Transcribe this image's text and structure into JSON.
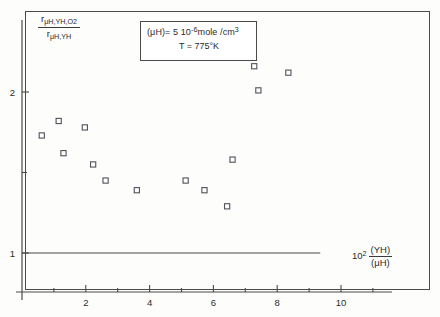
{
  "figure": {
    "background_color": "#fdfdfc",
    "frame_color": "#4a4a4a",
    "marker_color": "#50515a"
  },
  "annotations": {
    "legend_line1_prefix": "(μH)= 5 10",
    "legend_line1_exp": "-6",
    "legend_line1_suffix": "mole /cm",
    "legend_line1_suffix_exp": "3",
    "legend_line2": "T = 775°K"
  },
  "axis_titles": {
    "y_numerator_main": "r",
    "y_numerator_sub": "μH,YH,O",
    "y_numerator_sub2": "2",
    "y_denominator_main": "r",
    "y_denominator_sub": "μH,YH",
    "x_mantissa": "10",
    "x_exponent": "2",
    "x_numerator": "(YH)",
    "x_denominator": "(μH)"
  },
  "chart_data": {
    "type": "scatter",
    "title": "",
    "xlabel": "10^2 (YH)/(μH)",
    "ylabel": "r_{μH,YH,O2} / r_{μH,YH}",
    "xlim": [
      0,
      11.6
    ],
    "ylim": [
      0.78,
      2.55
    ],
    "grid": false,
    "legend_position": "top-center",
    "x_ticks_major": [
      2,
      4,
      6,
      8,
      10
    ],
    "x_ticks_major_labels": [
      "2",
      "4",
      "6",
      "8",
      "10"
    ],
    "x_ticks_minor": [
      1,
      3,
      5,
      7,
      9,
      11
    ],
    "y_ticks_major": [
      1,
      2
    ],
    "y_ticks_major_labels": [
      "1",
      "2"
    ],
    "y_ticks_minor": [
      1.5
    ],
    "reference_line": {
      "y": 1.0,
      "x_start": 0.0,
      "x_end": 9.35
    },
    "points": [
      {
        "x": 0.62,
        "y": 1.73
      },
      {
        "x": 1.15,
        "y": 1.82
      },
      {
        "x": 1.3,
        "y": 1.62
      },
      {
        "x": 1.97,
        "y": 1.78
      },
      {
        "x": 2.23,
        "y": 1.55
      },
      {
        "x": 2.62,
        "y": 1.45
      },
      {
        "x": 3.6,
        "y": 1.39
      },
      {
        "x": 5.13,
        "y": 1.45
      },
      {
        "x": 5.72,
        "y": 1.39
      },
      {
        "x": 6.43,
        "y": 1.29
      },
      {
        "x": 6.6,
        "y": 1.58
      },
      {
        "x": 7.28,
        "y": 2.16
      },
      {
        "x": 7.41,
        "y": 2.01
      },
      {
        "x": 8.35,
        "y": 2.12
      }
    ]
  }
}
